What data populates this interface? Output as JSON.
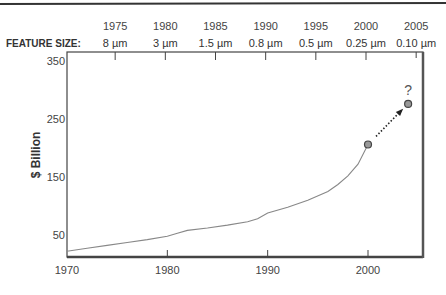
{
  "chart_data": {
    "type": "line",
    "title": "",
    "xlabel": "",
    "ylabel": "$ Billion",
    "xlim": [
      1970,
      2005.5
    ],
    "ylim": [
      12,
      350
    ],
    "x_ticks": [
      1970,
      1980,
      1990,
      2000
    ],
    "x_tick_labels": [
      "1970",
      "1980",
      "1990",
      "2000"
    ],
    "y_ticks": [
      50,
      150,
      250,
      350
    ],
    "y_tick_labels": [
      "50",
      "150",
      "250",
      "350"
    ],
    "top_axis": {
      "title": "FEATURE SIZE:",
      "ticks": [
        {
          "year": 1975,
          "year_label": "1975",
          "feature": "8 µm"
        },
        {
          "year": 1980,
          "year_label": "1980",
          "feature": "3 µm"
        },
        {
          "year": 1985,
          "year_label": "1985",
          "feature": "1.5 µm"
        },
        {
          "year": 1990,
          "year_label": "1990",
          "feature": "0.8 µm"
        },
        {
          "year": 1995,
          "year_label": "1995",
          "feature": "0.5 µm"
        },
        {
          "year": 2000,
          "year_label": "2000",
          "feature": "0.25 µm"
        },
        {
          "year": 2005,
          "year_label": "2005",
          "feature": "0.10 µm"
        }
      ]
    },
    "series": [
      {
        "name": "Market",
        "x": [
          1970,
          1972,
          1974,
          1976,
          1978,
          1980,
          1981,
          1982,
          1984,
          1986,
          1988,
          1989,
          1990,
          1992,
          1994,
          1996,
          1997,
          1998,
          1999,
          2000
        ],
        "values": [
          22,
          27,
          32,
          37,
          42,
          48,
          53,
          58,
          62,
          67,
          73,
          78,
          88,
          98,
          110,
          125,
          137,
          152,
          172,
          206
        ]
      }
    ],
    "points": [
      {
        "x": 2000,
        "y": 206,
        "label": ""
      },
      {
        "x": 2004,
        "y": 276,
        "label": "?"
      }
    ],
    "annotation": {
      "type": "dotted-arrow",
      "from": [
        2000.8,
        220
      ],
      "to": [
        2003.4,
        266
      ],
      "text": "?"
    },
    "grid": false,
    "legend": "none"
  }
}
